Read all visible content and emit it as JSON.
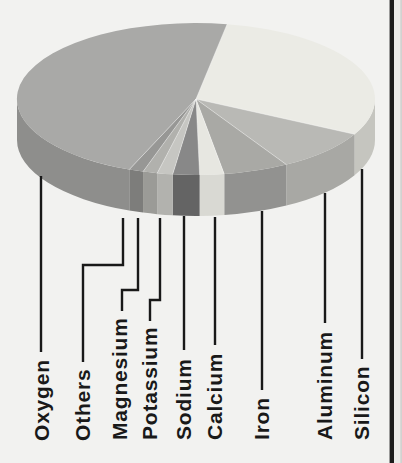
{
  "figure": {
    "background_color": "#f2f2f0",
    "ink_color": "#191919",
    "page_edge": {
      "border_line_color": "#1a1a1a",
      "outer_strip_color": "#e9e9e7",
      "outer_edge_color": "#d2d2d0"
    }
  },
  "chart_data": {
    "type": "pie",
    "projection": "3d-oblique",
    "title": "",
    "legend_position": "bottom-rotated-labels-with-leader-lines",
    "clockwise": true,
    "start_angle_deg": -80,
    "values_are_estimated_pct": true,
    "slices": [
      {
        "label": "Silicon",
        "value_pct": 29.9,
        "color_top": "#ebebe5",
        "color_side": "#c5c5bf"
      },
      {
        "label": "Aluminum",
        "value_pct": 8.9,
        "color_top": "#b9b9b5",
        "color_side": "#a8a8a4"
      },
      {
        "label": "Iron",
        "value_pct": 5.9,
        "color_top": "#a9a9a5",
        "color_side": "#929290"
      },
      {
        "label": "Calcium",
        "value_pct": 2.2,
        "color_top": "#e7e7e1",
        "color_side": "#d9d9d3"
      },
      {
        "label": "Sodium",
        "value_pct": 2.4,
        "color_top": "#888888",
        "color_side": "#646464"
      },
      {
        "label": "Potassium",
        "value_pct": 1.4,
        "color_top": "#c6c6c2",
        "color_side": "#b2b2ae"
      },
      {
        "label": "Magnesium",
        "value_pct": 1.3,
        "color_top": "#b1b1ad",
        "color_side": "#9b9b97"
      },
      {
        "label": "Others",
        "value_pct": 1.3,
        "color_top": "#979795",
        "color_side": "#7d7d7b"
      },
      {
        "label": "Oxygen",
        "value_pct": 46.7,
        "color_top": "#a9a9a7",
        "color_side": "#8e8e8c"
      }
    ]
  }
}
